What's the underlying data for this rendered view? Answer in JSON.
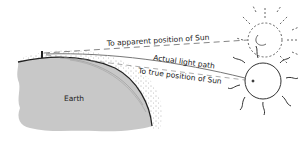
{
  "diagram": {
    "type": "atmospheric-refraction",
    "labels": {
      "apparent": "To apparent position of Sun",
      "actual": "Actual light path",
      "true": "To true position of Sun",
      "earth": "Earth"
    },
    "colors": {
      "earth_fill": "#c8c8c8",
      "line": "#777777",
      "sun_outline": "#333333",
      "background": "#ffffff"
    }
  }
}
